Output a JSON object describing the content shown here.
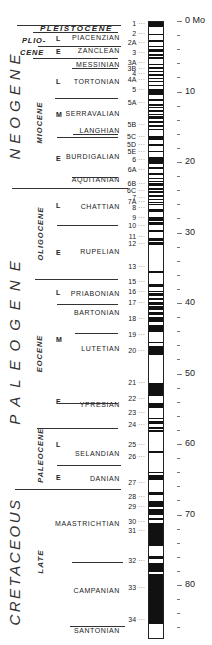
{
  "scale": {
    "unit_label": "Mo",
    "px_per_my": 7.05,
    "zero_y": 21,
    "labels": [
      {
        "value": "0 Mo",
        "age": 0
      },
      {
        "value": "10",
        "age": 10
      },
      {
        "value": "20",
        "age": 20
      },
      {
        "value": "30",
        "age": 30
      },
      {
        "value": "40",
        "age": 40
      },
      {
        "value": "50",
        "age": 50
      },
      {
        "value": "60",
        "age": 60
      },
      {
        "value": "70",
        "age": 70
      },
      {
        "value": "80",
        "age": 80
      }
    ]
  },
  "periods": [
    {
      "name": "NEOGENE",
      "top": 0,
      "bottom": 23.7
    },
    {
      "name": "PALEOGENE",
      "top": 23.7,
      "bottom": 66.4
    },
    {
      "name": "CRETACEOUS",
      "top": 66.4,
      "bottom": 87
    }
  ],
  "epochs": [
    {
      "name": "PLEISTOCENE",
      "top": 0,
      "bottom": 1.6
    },
    {
      "name": "PLIO-",
      "name2": "CENE",
      "top": 1.6,
      "bottom": 5.3
    },
    {
      "name": "MIOCENE",
      "top": 5.3,
      "bottom": 23.7
    },
    {
      "name": "OLIGOCENE",
      "top": 23.7,
      "bottom": 36.6
    },
    {
      "name": "EOCENE",
      "top": 36.6,
      "bottom": 57.8
    },
    {
      "name": "PALEOCENE",
      "top": 57.8,
      "bottom": 66.4
    },
    {
      "name": "LATE",
      "top": 66.4,
      "bottom": 87
    }
  ],
  "subdivisions": [
    {
      "label": "L",
      "age": 2.6
    },
    {
      "label": "E",
      "age": 4.4
    },
    {
      "label": "L",
      "age": 8.6
    },
    {
      "label": "M",
      "age": 13.3
    },
    {
      "label": "E",
      "age": 19.6
    },
    {
      "label": "L",
      "age": 26.2
    },
    {
      "label": "E",
      "age": 32.9
    },
    {
      "label": "L",
      "age": 38.6
    },
    {
      "label": "M",
      "age": 45.2
    },
    {
      "label": "E",
      "age": 54.0
    },
    {
      "label": "L",
      "age": 60.2
    },
    {
      "label": "E",
      "age": 64.8
    }
  ],
  "stages": [
    {
      "name": "PIACENZIAN",
      "label_age": 2.4
    },
    {
      "name": "ZANCLEAN",
      "label_age": 4.3
    },
    {
      "name": "MESSINIAN",
      "label_age": 6.2
    },
    {
      "name": "TORTONIAN",
      "label_age": 8.6
    },
    {
      "name": "SERRAVALIAN",
      "label_age": 13.2
    },
    {
      "name": "LANGHIAN",
      "label_age": 15.6
    },
    {
      "name": "BURDIGALIAN",
      "label_age": 19.3
    },
    {
      "name": "AQUITANIAN",
      "label_age": 22.6
    },
    {
      "name": "CHATTIAN",
      "label_age": 26.4
    },
    {
      "name": "RUPELIAN",
      "label_age": 32.8
    },
    {
      "name": "PRIABONIAN",
      "label_age": 38.7
    },
    {
      "name": "BARTONIAN",
      "label_age": 41.4
    },
    {
      "name": "LUTETIAN",
      "label_age": 46.5
    },
    {
      "name": "YPRESIAN",
      "label_age": 54.4
    },
    {
      "name": "SELANDIAN",
      "label_age": 61.4
    },
    {
      "name": "DANIAN",
      "label_age": 65.0
    },
    {
      "name": "MAASTRICHTIAN",
      "label_age": 71.3
    },
    {
      "name": "CAMPANIAN",
      "label_age": 80.8
    },
    {
      "name": "SANTONIAN",
      "label_age": 86.5
    }
  ],
  "chrons": [
    {
      "label": "1",
      "age": 0.4
    },
    {
      "label": "2",
      "age": 1.9
    },
    {
      "label": "2A",
      "age": 3.1
    },
    {
      "label": "3",
      "age": 4.6
    },
    {
      "label": "3A",
      "age": 5.9
    },
    {
      "label": "3B",
      "age": 6.8
    },
    {
      "label": "4",
      "age": 7.5
    },
    {
      "label": "4A",
      "age": 8.3
    },
    {
      "label": "5",
      "age": 9.8
    },
    {
      "label": "5A",
      "age": 11.6
    },
    {
      "label": "5B",
      "age": 14.8
    },
    {
      "label": "5C",
      "age": 16.4
    },
    {
      "label": "5D",
      "age": 17.6
    },
    {
      "label": "5E",
      "age": 18.6
    },
    {
      "label": "6",
      "age": 19.7
    },
    {
      "label": "6A",
      "age": 21.1
    },
    {
      "label": "6B",
      "age": 23.1
    },
    {
      "label": "6C",
      "age": 24.1
    },
    {
      "label": "7",
      "age": 25.1
    },
    {
      "label": "7A",
      "age": 25.7
    },
    {
      "label": "8",
      "age": 26.5
    },
    {
      "label": "9",
      "age": 27.9
    },
    {
      "label": "10",
      "age": 29.1
    },
    {
      "label": "11",
      "age": 30.6
    },
    {
      "label": "12",
      "age": 31.6
    },
    {
      "label": "13",
      "age": 34.9
    },
    {
      "label": "15",
      "age": 37.0
    },
    {
      "label": "16",
      "age": 38.4
    },
    {
      "label": "17",
      "age": 40.0
    },
    {
      "label": "18",
      "age": 42.3
    },
    {
      "label": "19",
      "age": 44.6
    },
    {
      "label": "20",
      "age": 46.8
    },
    {
      "label": "21",
      "age": 51.3
    },
    {
      "label": "22",
      "age": 53.6
    },
    {
      "label": "23",
      "age": 55.6
    },
    {
      "label": "24",
      "age": 57.3
    },
    {
      "label": "25",
      "age": 60.1
    },
    {
      "label": "26",
      "age": 61.9
    },
    {
      "label": "27",
      "age": 65.6
    },
    {
      "label": "28",
      "age": 67.5
    },
    {
      "label": "29",
      "age": 69.0
    },
    {
      "label": "30",
      "age": 71.0
    },
    {
      "label": "31",
      "age": 72.4
    },
    {
      "label": "32",
      "age": 76.6
    },
    {
      "label": "33",
      "age": 80.4
    },
    {
      "label": "34",
      "age": 84.9
    }
  ],
  "normal_polarity_bands": [
    [
      0.0,
      0.7
    ],
    [
      1.7,
      1.9
    ],
    [
      2.5,
      2.9
    ],
    [
      3.4,
      3.6
    ],
    [
      3.9,
      4.2
    ],
    [
      4.5,
      4.8
    ],
    [
      5.0,
      5.2
    ],
    [
      5.9,
      6.1
    ],
    [
      6.4,
      6.6
    ],
    [
      6.9,
      7.1
    ],
    [
      7.4,
      7.6
    ],
    [
      7.9,
      8.1
    ],
    [
      8.3,
      8.5
    ],
    [
      8.9,
      9.1
    ],
    [
      9.5,
      10.4
    ],
    [
      10.9,
      11.2
    ],
    [
      11.6,
      11.9
    ],
    [
      12.0,
      12.2
    ],
    [
      12.5,
      12.8
    ],
    [
      13.0,
      13.2
    ],
    [
      13.4,
      13.7
    ],
    [
      14.1,
      14.3
    ],
    [
      14.6,
      14.9
    ],
    [
      15.2,
      15.3
    ],
    [
      16.2,
      16.7
    ],
    [
      17.3,
      17.6
    ],
    [
      18.3,
      18.5
    ],
    [
      19.1,
      20.1
    ],
    [
      20.5,
      20.9
    ],
    [
      21.4,
      21.7
    ],
    [
      22.1,
      22.3
    ],
    [
      22.6,
      22.7
    ],
    [
      22.9,
      23.2
    ],
    [
      23.5,
      23.8
    ],
    [
      24.0,
      24.2
    ],
    [
      24.6,
      24.8
    ],
    [
      25.1,
      25.3
    ],
    [
      25.5,
      25.6
    ],
    [
      25.8,
      26.0
    ],
    [
      26.5,
      27.0
    ],
    [
      27.7,
      28.2
    ],
    [
      28.3,
      28.8
    ],
    [
      29.5,
      29.8
    ],
    [
      30.7,
      31.1
    ],
    [
      31.2,
      31.6
    ],
    [
      35.3,
      35.6
    ],
    [
      37.2,
      37.6
    ],
    [
      38.1,
      38.3
    ],
    [
      38.5,
      38.8
    ],
    [
      39.2,
      39.4
    ],
    [
      39.7,
      40.1
    ],
    [
      40.3,
      40.9
    ],
    [
      41.2,
      41.6
    ],
    [
      41.8,
      42.5
    ],
    [
      43.0,
      44.0
    ],
    [
      45.4,
      45.6
    ],
    [
      46.0,
      47.3
    ],
    [
      51.2,
      53.0
    ],
    [
      54.1,
      54.7
    ],
    [
      56.1,
      56.3
    ],
    [
      56.6,
      57.0
    ],
    [
      57.4,
      57.7
    ],
    [
      57.9,
      58.2
    ],
    [
      60.8,
      61.2
    ],
    [
      63.8,
      64.0
    ],
    [
      64.3,
      65.0
    ],
    [
      66.6,
      67.1
    ],
    [
      68.0,
      68.8
    ],
    [
      69.1,
      70.0
    ],
    [
      70.3,
      70.6
    ],
    [
      71.1,
      74.3
    ],
    [
      75.7,
      76.2
    ],
    [
      76.8,
      78.0
    ],
    [
      78.3,
      85.4
    ],
    [
      91.5,
      100
    ]
  ],
  "normal_polarity_bands_note": "",
  "minor_ticks": true
}
